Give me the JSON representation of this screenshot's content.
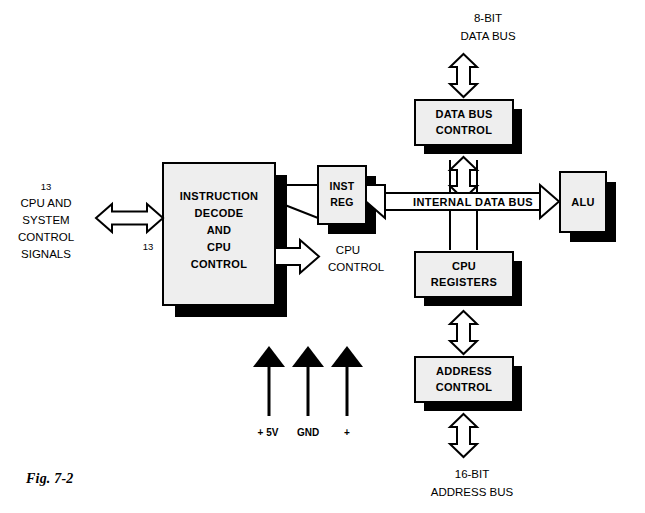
{
  "figure": {
    "caption": "Fig. 7-2"
  },
  "blocks": [
    {
      "id": "data-bus-control",
      "label_lines": [
        "DATA BUS",
        "CONTROL"
      ]
    },
    {
      "id": "instruction-decode",
      "label_lines": [
        "INSTRUCTION",
        "DECODE",
        "AND",
        "CPU",
        "CONTROL"
      ]
    },
    {
      "id": "inst-reg",
      "label_lines": [
        "INST",
        "REG"
      ]
    },
    {
      "id": "alu",
      "label_lines": [
        "ALU"
      ]
    },
    {
      "id": "cpu-registers",
      "label_lines": [
        "CPU",
        "REGISTERS"
      ]
    },
    {
      "id": "address-control",
      "label_lines": [
        "ADDRESS",
        "CONTROL"
      ]
    }
  ],
  "bus_labels": {
    "data_bus_top_line1": "8-BIT",
    "data_bus_top_line2": "DATA BUS",
    "address_bus_bottom_line1": "16-BIT",
    "address_bus_bottom_line2": "ADDRESS BUS",
    "internal_data_bus": "INTERNAL DATA BUS"
  },
  "left_signals": {
    "count_top": "13",
    "line1": "CPU AND",
    "line2": "SYSTEM",
    "line3": "CONTROL",
    "line4": "SIGNALS",
    "count_under_arrow": "13"
  },
  "cpu_control_output": {
    "line1": "CPU",
    "line2": "CONTROL"
  },
  "power_inputs": [
    {
      "id": "supply-5v",
      "label": "+ 5V"
    },
    {
      "id": "ground",
      "label": "GND"
    },
    {
      "id": "supply-plus",
      "label": "+"
    }
  ],
  "colors": {
    "block_face": "#eeeeee",
    "block_shadow": "#000000",
    "stroke": "#000000",
    "background": "#ffffff"
  }
}
